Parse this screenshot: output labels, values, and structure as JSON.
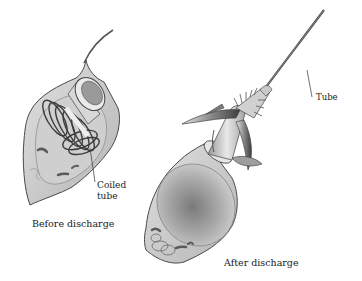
{
  "figure": {
    "panels": [
      {
        "id": "before",
        "caption": "Before discharge"
      },
      {
        "id": "after",
        "caption": "After discharge"
      }
    ],
    "callouts": {
      "coiled_tube": "Coiled tube",
      "tube": "Tube"
    },
    "colors": {
      "capsule_fill": "#c9c9c9",
      "capsule_stroke": "#4a4a4a",
      "dark_shade": "#5a5a5a",
      "background": "#ffffff",
      "text": "#1a1a1a"
    }
  }
}
